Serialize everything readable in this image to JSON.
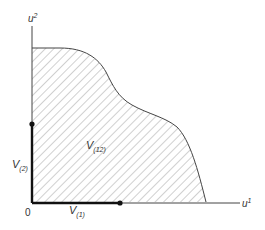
{
  "diagram": {
    "type": "utility-possibility-set",
    "axes": {
      "x": {
        "label": "u",
        "superscript": "1"
      },
      "y": {
        "label": "u",
        "superscript": "2"
      },
      "origin_label": "0"
    },
    "region": {
      "label": "V",
      "subscript": "(12)",
      "fill": "hatched"
    },
    "segments": [
      {
        "label": "V",
        "subscript": "(1)",
        "axis": "x"
      },
      {
        "label": "V",
        "subscript": "(2)",
        "axis": "y"
      }
    ],
    "colors": {
      "ink": "#333333",
      "hatch": "#888888",
      "background": "#ffffff"
    }
  }
}
